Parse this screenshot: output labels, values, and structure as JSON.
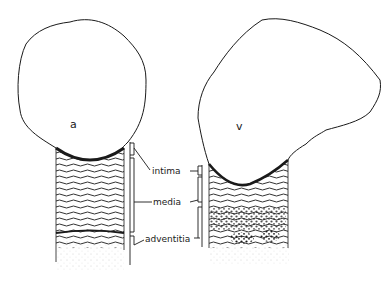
{
  "figure": {
    "vessels": [
      {
        "id": "artery",
        "label": "a"
      },
      {
        "id": "vein",
        "label": "v"
      }
    ],
    "layers": [
      {
        "label": "intima"
      },
      {
        "label": "media"
      },
      {
        "label": "adventitia"
      }
    ],
    "colors": {
      "ink": "#1a1a1a",
      "background": "#ffffff",
      "stipple": "#9a9a9a"
    }
  }
}
